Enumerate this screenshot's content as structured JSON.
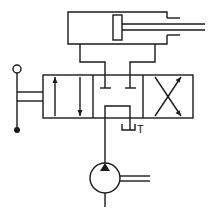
{
  "diagram": {
    "type": "hydraulic-circuit",
    "components": [
      {
        "id": "cylinder",
        "kind": "double-acting cylinder"
      },
      {
        "id": "valve",
        "kind": "4/3 directional control valve, closed center, lever operated"
      },
      {
        "id": "pump",
        "kind": "fixed displacement hydraulic pump"
      }
    ],
    "labels": {
      "tank_port": "T"
    },
    "colors": {
      "line": "#1a1a1a",
      "background": "#ffffff"
    }
  }
}
